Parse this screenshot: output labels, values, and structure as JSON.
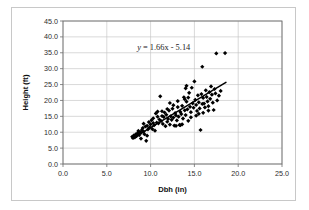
{
  "chart_data": {
    "type": "scatter",
    "title": "",
    "xlabel": "Dbh (in)",
    "ylabel": "Height (ft)",
    "xlim": [
      0.0,
      25.0
    ],
    "ylim": [
      0.0,
      45.0
    ],
    "xticks": [
      "0.0",
      "5.0",
      "10.0",
      "15.0",
      "20.0",
      "25.0"
    ],
    "yticks": [
      "0.0",
      "5.0",
      "10.0",
      "15.0",
      "20.0",
      "25.0",
      "30.0",
      "35.0",
      "40.0",
      "45.0"
    ],
    "xtick_values": [
      0,
      5,
      10,
      15,
      20,
      25
    ],
    "ytick_values": [
      0,
      5,
      10,
      15,
      20,
      25,
      30,
      35,
      40,
      45
    ],
    "grid": "horizontal-and-vertical",
    "legend": "none",
    "marker": "diamond",
    "marker_color": "#000000",
    "annotations": [
      {
        "name": "regression-equation",
        "text": "y = 1.66x - 5.14",
        "text_y": "y",
        "text_rest": " = 1.66x - 5.14",
        "x": 11.5,
        "y": 36.0
      }
    ],
    "trendline": {
      "type": "linear",
      "slope": 1.66,
      "intercept": -5.14,
      "x_start": 7.9,
      "x_end": 18.6,
      "y_start": 8.0,
      "y_end": 25.7,
      "color": "#000000"
    },
    "points": [
      [
        7.9,
        8.6
      ],
      [
        8.0,
        8.2
      ],
      [
        8.1,
        9.0
      ],
      [
        8.2,
        8.4
      ],
      [
        8.3,
        9.3
      ],
      [
        8.4,
        8.8
      ],
      [
        8.5,
        9.6
      ],
      [
        8.6,
        10.4
      ],
      [
        8.7,
        9.1
      ],
      [
        8.8,
        10.0
      ],
      [
        8.9,
        9.8
      ],
      [
        9.0,
        10.7
      ],
      [
        9.1,
        11.3
      ],
      [
        9.2,
        10.2
      ],
      [
        9.3,
        9.4
      ],
      [
        9.4,
        11.8
      ],
      [
        9.5,
        7.3
      ],
      [
        9.6,
        12.0
      ],
      [
        9.7,
        10.9
      ],
      [
        9.8,
        13.2
      ],
      [
        9.9,
        11.5
      ],
      [
        10.0,
        12.5
      ],
      [
        10.1,
        13.8
      ],
      [
        10.2,
        11.0
      ],
      [
        10.3,
        14.4
      ],
      [
        10.4,
        12.2
      ],
      [
        10.5,
        10.5
      ],
      [
        10.6,
        15.9
      ],
      [
        10.7,
        13.0
      ],
      [
        10.8,
        16.5
      ],
      [
        10.9,
        12.8
      ],
      [
        11.0,
        14.0
      ],
      [
        11.1,
        21.3
      ],
      [
        11.2,
        13.5
      ],
      [
        11.3,
        15.1
      ],
      [
        11.4,
        12.6
      ],
      [
        11.5,
        14.8
      ],
      [
        11.6,
        16.2
      ],
      [
        11.7,
        11.9
      ],
      [
        11.8,
        15.5
      ],
      [
        11.9,
        13.3
      ],
      [
        12.0,
        14.2
      ],
      [
        12.1,
        16.8
      ],
      [
        12.2,
        12.4
      ],
      [
        12.3,
        15.0
      ],
      [
        12.4,
        13.9
      ],
      [
        12.5,
        17.4
      ],
      [
        12.6,
        14.6
      ],
      [
        12.7,
        12.1
      ],
      [
        12.8,
        16.0
      ],
      [
        12.9,
        15.3
      ],
      [
        13.0,
        13.7
      ],
      [
        13.1,
        17.9
      ],
      [
        13.2,
        14.9
      ],
      [
        13.3,
        12.3
      ],
      [
        13.4,
        16.4
      ],
      [
        13.5,
        15.7
      ],
      [
        13.6,
        18.3
      ],
      [
        13.7,
        14.3
      ],
      [
        13.8,
        21.0
      ],
      [
        13.9,
        16.9
      ],
      [
        14.0,
        15.4
      ],
      [
        14.1,
        19.6
      ],
      [
        14.2,
        17.2
      ],
      [
        14.3,
        13.6
      ],
      [
        14.4,
        22.4
      ],
      [
        14.5,
        18.0
      ],
      [
        14.6,
        16.3
      ],
      [
        14.7,
        24.0
      ],
      [
        14.8,
        19.1
      ],
      [
        14.9,
        17.7
      ],
      [
        15.0,
        26.0
      ],
      [
        15.1,
        20.2
      ],
      [
        15.2,
        18.6
      ],
      [
        15.3,
        16.7
      ],
      [
        15.4,
        21.6
      ],
      [
        15.5,
        19.4
      ],
      [
        15.6,
        17.5
      ],
      [
        15.7,
        10.7
      ],
      [
        15.8,
        22.0
      ],
      [
        15.9,
        18.9
      ],
      [
        16.0,
        20.8
      ],
      [
        16.1,
        19.0
      ],
      [
        16.2,
        17.8
      ],
      [
        16.3,
        23.2
      ],
      [
        16.4,
        21.1
      ],
      [
        16.5,
        19.7
      ],
      [
        16.6,
        18.2
      ],
      [
        16.7,
        22.6
      ],
      [
        16.8,
        20.5
      ],
      [
        16.9,
        24.4
      ],
      [
        17.0,
        21.8
      ],
      [
        17.1,
        19.3
      ],
      [
        17.2,
        17.0
      ],
      [
        17.3,
        23.6
      ],
      [
        17.4,
        22.2
      ],
      [
        17.5,
        34.8
      ],
      [
        17.6,
        20.0
      ],
      [
        17.8,
        21.5
      ],
      [
        18.0,
        23.0
      ],
      [
        18.5,
        34.9
      ],
      [
        15.9,
        30.6
      ],
      [
        14.0,
        23.8
      ],
      [
        14.1,
        24.6
      ],
      [
        13.9,
        20.4
      ],
      [
        12.2,
        19.2
      ],
      [
        11.3,
        16.6
      ],
      [
        10.3,
        12.9
      ],
      [
        9.6,
        8.9
      ],
      [
        8.9,
        8.0
      ],
      [
        13.4,
        12.2
      ],
      [
        13.6,
        12.5
      ],
      [
        12.9,
        12.0
      ],
      [
        14.6,
        14.7
      ],
      [
        15.2,
        15.2
      ],
      [
        16.0,
        16.1
      ],
      [
        16.6,
        16.8
      ],
      [
        11.9,
        17.3
      ],
      [
        10.8,
        14.9
      ],
      [
        12.6,
        18.5
      ],
      [
        13.1,
        19.8
      ],
      [
        14.3,
        20.9
      ],
      [
        15.5,
        15.8
      ],
      [
        9.2,
        12.7
      ],
      [
        8.6,
        9.9
      ]
    ]
  },
  "axes": {
    "y_axis_title": "Height (ft)",
    "x_axis_title": "Dbh (in)"
  }
}
